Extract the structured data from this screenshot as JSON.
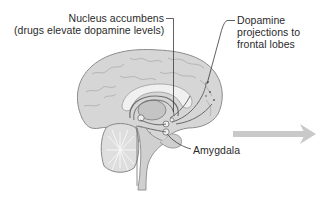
{
  "figure": {
    "type": "anatomical-diagram",
    "colors": {
      "background": "#ffffff",
      "brain_fill": "#d4d4d4",
      "brain_outline": "#8a8a8a",
      "inner_structures": "#bdbdbd",
      "pathway_lines": "#6e6e6e",
      "leader_lines": "#3a3a3a",
      "label_text": "#2a2a2a",
      "arrow": "#c9c9c9"
    },
    "labels": {
      "nucleus_accumbens": {
        "line1": "Nucleus accumbens",
        "line2": "(drugs elevate dopamine levels)"
      },
      "dopamine_projections": {
        "line1": "Dopamine",
        "line2": "projections to",
        "line3": "frontal lobes"
      },
      "amygdala": {
        "line1": "Amygdala"
      }
    },
    "arrow": {
      "direction": "right",
      "icon": "arrow-right-icon"
    }
  }
}
